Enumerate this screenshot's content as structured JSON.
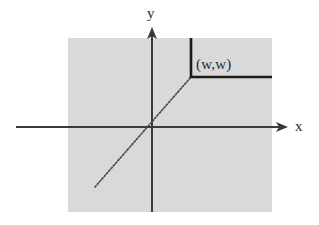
{
  "figure": {
    "background_color": "#ffffff",
    "shaded_region": {
      "name": "quadrant-shading",
      "color": "#d9d9d9",
      "x": 68,
      "y": 38,
      "width": 204,
      "height": 174
    },
    "axes": {
      "color": "#3a3a3a",
      "origin": {
        "x": 152,
        "y": 127
      },
      "x_axis": {
        "label": "x",
        "from_x": 16,
        "to_x": 288,
        "y": 127,
        "arrow": "right"
      },
      "y_axis": {
        "label": "y",
        "x": 152,
        "from_y": 212,
        "to_y": 28,
        "arrow": "up"
      }
    },
    "diagonal_line": {
      "name": "identity-line",
      "style": "dotted",
      "color": "#4a4a4a",
      "x1": 95,
      "y1": 187,
      "x2": 191,
      "y2": 77
    },
    "step_curve": {
      "name": "threshold-curve",
      "color": "#1a1a1a",
      "stroke_width": 2.6,
      "vertical_segment": {
        "x": 191,
        "y1": 38,
        "y2": 77
      },
      "horizontal_segment": {
        "y": 77,
        "x1": 191,
        "x2": 272
      }
    },
    "point_label": {
      "text": "(w,w)",
      "x": 196,
      "y": 57
    }
  }
}
